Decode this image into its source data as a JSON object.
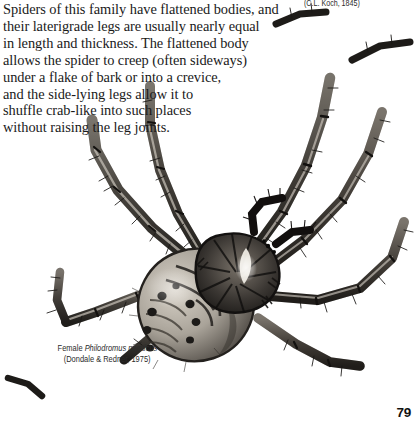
{
  "page": {
    "number": "79",
    "background_color": "#ffffff",
    "ink_color": "#1a1a1a"
  },
  "body_text": {
    "lines": [
      "Spiders of this family have flattened bodies, and",
      "their laterigrade legs are usually nearly equal",
      "in length and thickness. The flattened body",
      "allows the spider to creep (often sideways)",
      "under a flake of bark or into a crevice,",
      "and the side-lying legs allow it to",
      "shuffle crab-like into such places",
      "without raising the leg joints."
    ]
  },
  "caption_top_right": {
    "text": "(C.L. Koch, 1845)"
  },
  "caption_figure": {
    "line1_prefix": "Female ",
    "line1_species": "Philodromus mysticus",
    "line2": "(Dondale & Redner, 1975)"
  },
  "illustration": {
    "subject": "spider-illustration",
    "common_name": "laterigrade crab spider, dorsal view",
    "style": "grayscale stipple and ink drawing",
    "colors": {
      "leg_light": "#b9b3ab",
      "leg_mid": "#8c867e",
      "leg_dark": "#3a3632",
      "leg_tip": "#151312",
      "abdomen_light": "#c8c2b8",
      "abdomen_mid": "#9a948a",
      "abdomen_dark": "#322e2a",
      "carapace_dark": "#2a2724",
      "carapace_highlight": "#efece4",
      "outline": "#1b1917"
    },
    "parts": [
      "abdomen",
      "carapace",
      "pedipalps",
      "leg-front-left",
      "leg-front-right",
      "leg-second-left",
      "leg-second-right",
      "leg-third-left",
      "leg-third-right",
      "leg-fourth-left",
      "leg-fourth-right"
    ]
  }
}
